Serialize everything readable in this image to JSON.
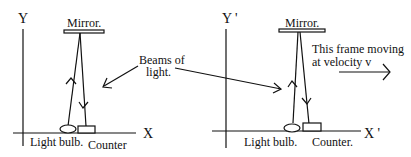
{
  "diagram": {
    "left_frame": {
      "y_axis_label": "Y",
      "x_axis_label": "X",
      "mirror_label": "Mirror.",
      "bulb_label": "Light bulb.",
      "counter_label": "Counter"
    },
    "right_frame": {
      "y_axis_label": "Y '",
      "x_axis_label": "X '",
      "mirror_label": "Mirror.",
      "bulb_label": "Light bulb.",
      "counter_label": "Counter.",
      "motion_label_line1": "This frame moving",
      "motion_label_line2": "at velocity v"
    },
    "beams_label_line1": "Beams of",
    "beams_label_line2": "light.",
    "colors": {
      "ink": "#111111",
      "background": "#ffffff"
    }
  }
}
